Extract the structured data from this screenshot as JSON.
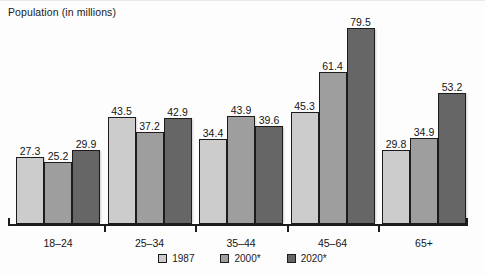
{
  "chart_data": {
    "type": "bar",
    "title": "Population (in millions)",
    "xlabel": "",
    "ylabel": "",
    "ylim": [
      0,
      85
    ],
    "grid": false,
    "legend_position": "bottom-center",
    "categories": [
      "18–24",
      "25–34",
      "35–44",
      "45–64",
      "65+"
    ],
    "series": [
      {
        "name": "1987",
        "color": "#cccccc",
        "values": [
          27.3,
          43.5,
          34.4,
          45.3,
          29.8
        ]
      },
      {
        "name": "2000*",
        "color": "#9e9e9e",
        "values": [
          25.2,
          37.2,
          43.9,
          61.4,
          34.9
        ]
      },
      {
        "name": "2020*",
        "color": "#666666",
        "values": [
          29.9,
          42.9,
          39.6,
          79.5,
          53.2
        ]
      }
    ],
    "value_labels": [
      [
        "27.3",
        "25.2",
        "29.9"
      ],
      [
        "43.5",
        "37.2",
        "42.9"
      ],
      [
        "34.4",
        "43.9",
        "39.6"
      ],
      [
        "45.3",
        "61.4",
        "79.5"
      ],
      [
        "29.8",
        "34.9",
        "53.2"
      ]
    ]
  },
  "legend": {
    "items": [
      {
        "label": "1987"
      },
      {
        "label": "2000*"
      },
      {
        "label": "2020*"
      }
    ]
  }
}
